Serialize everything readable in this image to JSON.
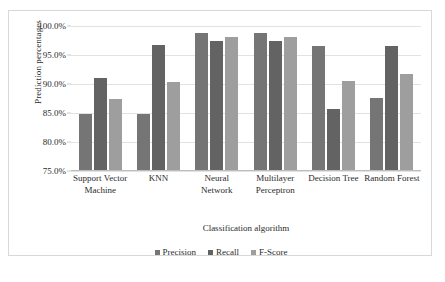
{
  "chart_data": {
    "type": "bar",
    "title": "",
    "xlabel": "Classification algorithm",
    "ylabel": "Prediction percentages",
    "ylim": [
      75.0,
      100.0
    ],
    "ytick_labels": [
      "100.0%",
      "95.0%",
      "90.0%",
      "85.0%",
      "80.0%",
      "75.0%"
    ],
    "ytick_values": [
      100.0,
      95.0,
      90.0,
      85.0,
      80.0,
      75.0
    ],
    "grid": true,
    "legend_position": "bottom",
    "categories": [
      "Support Vector Machine",
      "KNN",
      "Neural Network",
      "Multilayer Perceptron",
      "Decision Tree",
      "Random Forest"
    ],
    "series": [
      {
        "name": "Precision",
        "color": "#757575",
        "values": [
          84.9,
          84.9,
          98.8,
          98.8,
          96.5,
          87.6
        ]
      },
      {
        "name": "Recall",
        "color": "#636363",
        "values": [
          91.1,
          96.8,
          97.5,
          97.5,
          85.7,
          96.5
        ]
      },
      {
        "name": "F-Score",
        "color": "#9e9e9e",
        "values": [
          87.5,
          90.4,
          98.1,
          98.1,
          90.6,
          91.8
        ]
      }
    ]
  },
  "caption": {
    "text": ""
  }
}
